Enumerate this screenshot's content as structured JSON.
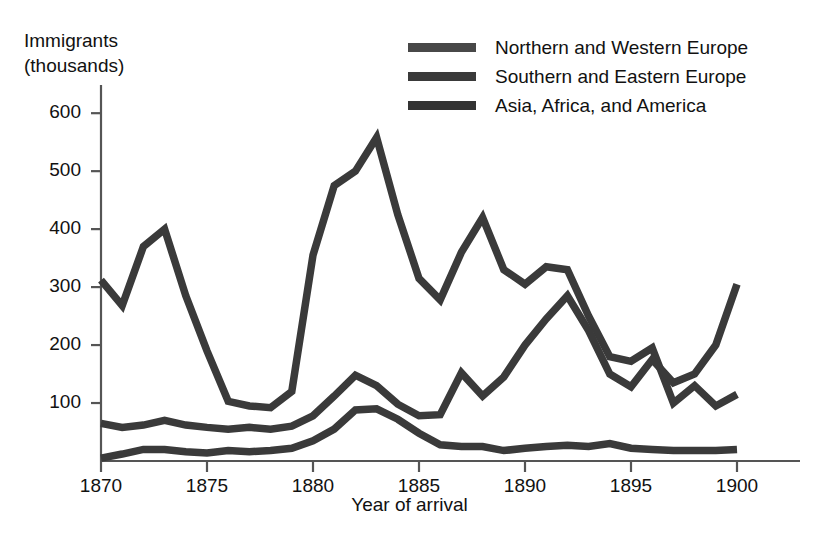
{
  "chart_data": {
    "type": "line",
    "title": "",
    "ylabel": "Immigrants\n(thousands)",
    "ylabel_line1": "Immigrants",
    "ylabel_line2": "(thousands)",
    "xlabel": "Year of arrival",
    "xlim": [
      1870,
      1900
    ],
    "ylim": [
      0,
      640
    ],
    "grid": false,
    "legend_position": "top-right",
    "yticks": [
      100,
      200,
      300,
      400,
      500,
      600
    ],
    "ytick_labels": [
      "100",
      "200",
      "300",
      "400",
      "500",
      "600"
    ],
    "xticks": [
      1870,
      1875,
      1880,
      1885,
      1890,
      1895,
      1900
    ],
    "xtick_labels": [
      "1870",
      "1875",
      "1880",
      "1885",
      "1890",
      "1895",
      "1900"
    ],
    "x": [
      1870,
      1871,
      1872,
      1873,
      1874,
      1875,
      1876,
      1877,
      1878,
      1879,
      1880,
      1881,
      1882,
      1883,
      1884,
      1885,
      1886,
      1887,
      1888,
      1889,
      1890,
      1891,
      1892,
      1893,
      1894,
      1895,
      1896,
      1897,
      1898,
      1899,
      1900
    ],
    "series": [
      {
        "name": "Northern and Western Europe",
        "color": "#3a3a3a",
        "values": [
          312,
          268,
          370,
          400,
          285,
          190,
          103,
          95,
          92,
          120,
          355,
          475,
          500,
          558,
          425,
          315,
          278,
          360,
          420,
          330,
          305,
          335,
          330,
          250,
          180,
          172,
          195,
          100,
          130,
          95,
          115
        ]
      },
      {
        "name": "Southern and Eastern Europe",
        "color": "#3a3a3a",
        "values": [
          65,
          58,
          62,
          70,
          62,
          58,
          55,
          58,
          55,
          60,
          78,
          112,
          148,
          130,
          98,
          78,
          80,
          152,
          112,
          145,
          200,
          245,
          285,
          225,
          150,
          128,
          175,
          135,
          150,
          200,
          305
        ]
      },
      {
        "name": "Asia, Africa, and America",
        "color": "#3a3a3a",
        "values": [
          5,
          12,
          20,
          20,
          16,
          14,
          18,
          16,
          18,
          22,
          35,
          55,
          88,
          90,
          72,
          48,
          28,
          25,
          25,
          18,
          22,
          25,
          27,
          25,
          30,
          22,
          20,
          18,
          18,
          18,
          20
        ]
      }
    ]
  },
  "legend": {
    "items": [
      {
        "label": "Northern and Western Europe",
        "color": "#484848"
      },
      {
        "label": "Southern and Eastern Europe",
        "color": "#3a3a3a"
      },
      {
        "label": "Asia, Africa, and America",
        "color": "#333333"
      }
    ]
  },
  "axes": {
    "y_title_line1": "Immigrants",
    "y_title_line2": "(thousands)",
    "x_title": "Year of arrival",
    "axis_color": "#555555"
  }
}
